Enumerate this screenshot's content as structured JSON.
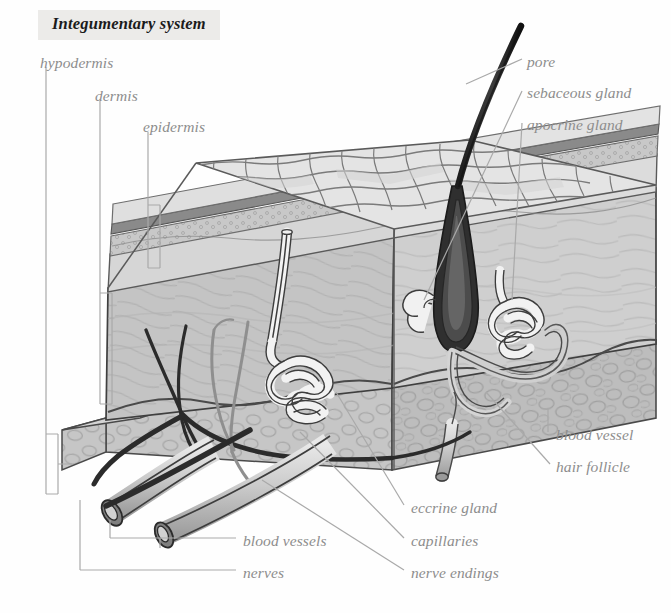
{
  "header": {
    "title": "Integumentary system"
  },
  "colors": {
    "title_band_bg": "#ecebe9",
    "title_text": "#1b1b1b",
    "label_text": "#8d8d8d",
    "leader_line": "#a9a9a9",
    "outline_dark": "#3a3a3a",
    "outline_mid": "#6e6e6e",
    "skin_light": "#e2e2e2",
    "skin_mid": "#cfcfcf",
    "skin_dark": "#b4b4b4",
    "hypodermis_fill": "#bdbdbd",
    "stratum_band": "#8c8c8c",
    "hair_dark": "#2b2b2b",
    "gland_white": "#f4f4f4",
    "background": "#fefefe"
  },
  "layer_labels": [
    {
      "id": "hypodermis",
      "text": "hypodermis",
      "x": 40,
      "y": 55
    },
    {
      "id": "dermis",
      "text": "dermis",
      "x": 95,
      "y": 88
    },
    {
      "id": "epidermis",
      "text": "epidermis",
      "x": 143,
      "y": 119
    }
  ],
  "structure_labels": [
    {
      "id": "pore",
      "text": "pore",
      "x": 527,
      "y": 54
    },
    {
      "id": "sebaceous-gland",
      "text": "sebaceous gland",
      "x": 527,
      "y": 85
    },
    {
      "id": "apocrine-gland",
      "text": "apocrine gland",
      "x": 527,
      "y": 117
    },
    {
      "id": "blood-vessel",
      "text": "blood vessel",
      "x": 556,
      "y": 427
    },
    {
      "id": "hair-follicle",
      "text": "hair follicle",
      "x": 556,
      "y": 459
    },
    {
      "id": "eccrine-gland",
      "text": "eccrine gland",
      "x": 411,
      "y": 500
    },
    {
      "id": "capillaries",
      "text": "capillaries",
      "x": 411,
      "y": 533
    },
    {
      "id": "nerve-endings",
      "text": "nerve endings",
      "x": 411,
      "y": 565
    },
    {
      "id": "blood-vessels",
      "text": "blood vessels",
      "x": 243,
      "y": 533
    },
    {
      "id": "nerves",
      "text": "nerves",
      "x": 243,
      "y": 565
    }
  ],
  "diagram": {
    "layers": [
      "epidermis",
      "dermis",
      "hypodermis"
    ],
    "structures": [
      "pore",
      "sebaceous gland",
      "apocrine gland",
      "eccrine gland",
      "hair follicle",
      "hair shaft",
      "blood vessel",
      "blood vessels",
      "capillaries",
      "nerves",
      "nerve endings"
    ]
  }
}
